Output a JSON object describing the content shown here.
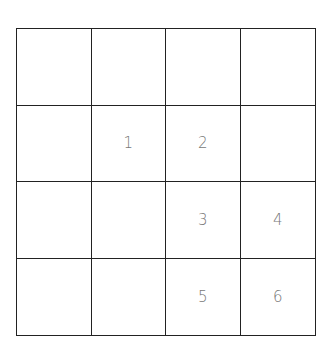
{
  "grid": {
    "rows": 4,
    "cols": 4,
    "cells": [
      [
        "",
        "",
        "",
        ""
      ],
      [
        "",
        "1",
        "2",
        ""
      ],
      [
        "",
        "",
        "3",
        "4"
      ],
      [
        "",
        "",
        "5",
        "6"
      ]
    ]
  },
  "colors": {
    "line": "#222222",
    "label": "#777777",
    "background": "#ffffff"
  }
}
